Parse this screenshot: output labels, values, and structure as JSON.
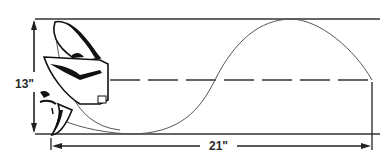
{
  "diagram": {
    "labels": {
      "diameter": "13\"",
      "pitch": "21\""
    },
    "colors": {
      "line": "#2a2a2a",
      "curve": "#555555",
      "background": "#ffffff"
    }
  }
}
